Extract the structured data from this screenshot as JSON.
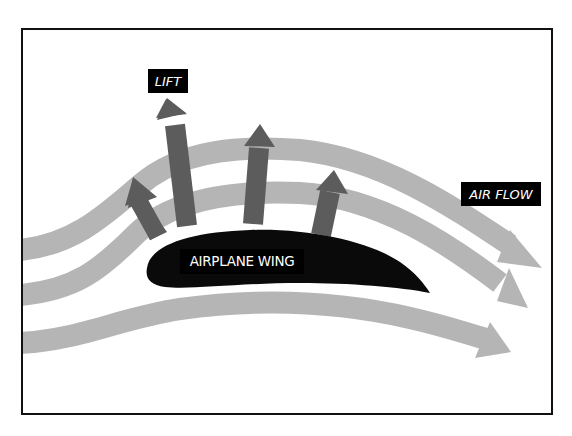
{
  "diagram": {
    "labels": {
      "lift": "LIFT",
      "air_flow": "AIR FLOW",
      "wing": "AIRPLANE WING"
    },
    "colors": {
      "frame": "#111111",
      "airflow_stream": "#b5b5b5",
      "lift_arrow": "#5c5c5c",
      "wing": "#0a0a0a",
      "label_bg": "#000000",
      "label_text": "#ffffff"
    },
    "elements": {
      "airflow_streams": 3,
      "lift_arrows": 4
    }
  }
}
